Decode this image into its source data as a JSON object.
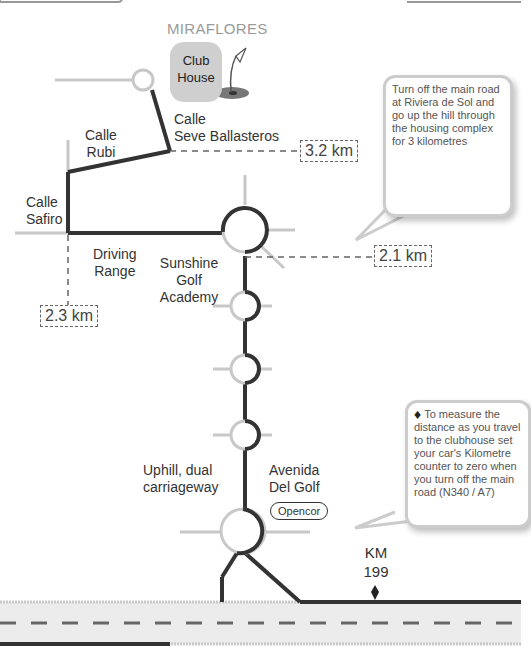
{
  "title": "MIRAFLORES",
  "clubhouse": {
    "label_line1": "Club",
    "label_line2": "House"
  },
  "streets": {
    "seve_line1": "Calle",
    "seve_line2": "Seve Ballasteros",
    "rubi_line1": "Calle",
    "rubi_line2": "Rubi",
    "safiro_line1": "Calle",
    "safiro_line2": "Safiro",
    "driving_line1": "Driving",
    "driving_line2": "Range",
    "sunshine_line1": "Sunshine",
    "sunshine_line2": "Golf",
    "sunshine_line3": "Academy",
    "uphill_line1": "Uphill, dual",
    "uphill_line2": "carriageway",
    "avenida_line1": "Avenida",
    "avenida_line2": "Del Golf"
  },
  "distances": {
    "d1": "3.2 km",
    "d2": "2.1 km",
    "d3": "2.3 km"
  },
  "landmark": "Opencor",
  "km_marker": {
    "line1": "KM",
    "line2": "199"
  },
  "bubbles": {
    "top": "Turn off the main road at Riviera de Sol and go up the hill through the housing complex for 3 kilometres",
    "bottom": "To measure the distance as you travel to the clubhouse set your car's Kilometre counter to zero when you turn off the main road (N340 / A7)"
  },
  "colors": {
    "route": "#333333",
    "side_road": "#c8c8c8",
    "road_fill": "#e8e8e8"
  }
}
